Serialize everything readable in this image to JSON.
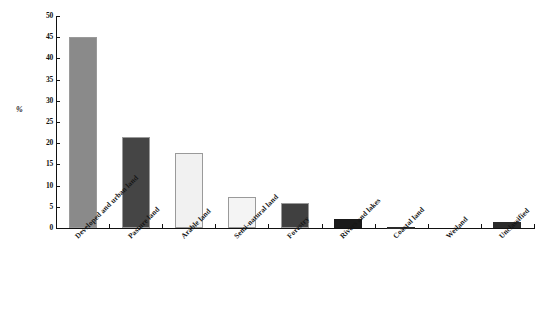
{
  "chart_data": {
    "type": "bar",
    "title": "",
    "xlabel": "",
    "ylabel": "%",
    "ylim": [
      0,
      50
    ],
    "ytick_step": 5,
    "yticks": [
      "50",
      "45",
      "40",
      "35",
      "30",
      "25",
      "20",
      "15",
      "10",
      "5",
      "0"
    ],
    "grid": false,
    "legend": false,
    "categories": [
      "Developed and urban land",
      "Pasture land",
      "Arable land",
      "Semi-natural land",
      "Forestry",
      "Rivers and lakes",
      "Coastal land",
      "Wetland",
      "Unclassified"
    ],
    "values": [
      45.1,
      21.5,
      17.7,
      7.3,
      5.9,
      2.1,
      0.15,
      0.0,
      1.3
    ],
    "bar_colors": [
      "#8a8a8a",
      "#454545",
      "#f1f1f1",
      "#f4f4f4",
      "#404040",
      "#1a1a1a",
      "#2a2a2a",
      "#2a2a2a",
      "#2b2b2b"
    ],
    "bar_border_color": "#9a9a9a",
    "axis_color": "#111111"
  }
}
